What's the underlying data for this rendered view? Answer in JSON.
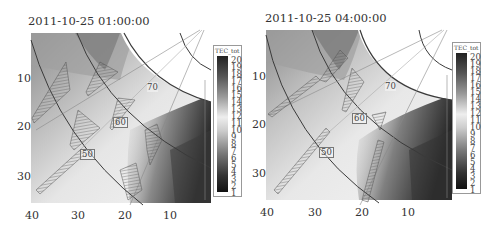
{
  "panels": [
    {
      "title": "2011-10-25 01:00:00",
      "y_ticks": [
        "10",
        "20",
        "30"
      ],
      "x_ticks": [
        "40",
        "30",
        "20",
        "10"
      ],
      "contour_labels": [
        "70",
        "60",
        "50"
      ],
      "colorbar": {
        "label": "TEC_tot",
        "ticks": [
          "20",
          "19",
          "18",
          "17",
          "16",
          "15",
          "14",
          "13",
          "12",
          "11",
          "10",
          "9",
          "8",
          "7",
          "6",
          "5",
          "4",
          "3",
          "2",
          "1"
        ]
      }
    },
    {
      "title": "2011-10-25 04:00:00",
      "y_ticks": [
        "10",
        "20",
        "30"
      ],
      "x_ticks": [
        "40",
        "30",
        "20",
        "10"
      ],
      "contour_labels": [
        "70",
        "60",
        "50"
      ],
      "colorbar": {
        "label": "TEC_tot",
        "ticks": [
          "20",
          "19",
          "18",
          "17",
          "16",
          "15",
          "14",
          "13",
          "12",
          "11",
          "10",
          "9",
          "8",
          "7",
          "6",
          "5",
          "4",
          "3",
          "2",
          "1"
        ]
      }
    }
  ],
  "colors": {
    "dark": "#2a2a2a",
    "mid": "#8a8a8a",
    "light": "#e8e8e8",
    "contour": "#3a3a3a"
  }
}
